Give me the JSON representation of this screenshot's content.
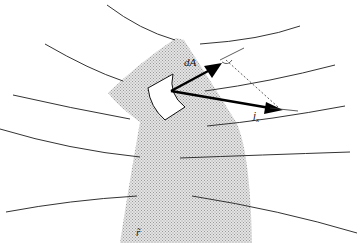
{
  "diagram": {
    "type": "flux-through-surface",
    "labels": {
      "area_vector": "dA",
      "current_density": "j",
      "current_density_subscript": "x",
      "region_symbol": "r̃"
    },
    "colors": {
      "region_fill": "#c8c8c8",
      "lines": "#333333",
      "arrows": "#000000"
    },
    "elements": {
      "field_lines_count": 9,
      "has_right_angle_marker": true,
      "has_dashed_projection": true
    }
  }
}
